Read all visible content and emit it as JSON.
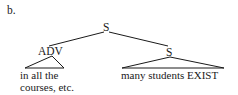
{
  "example_label": "b.",
  "tree": {
    "root": {
      "label": "S",
      "children": [
        {
          "label": "ADV",
          "terminal_lines": [
            "in all the",
            "courses, etc."
          ],
          "triangle": true
        },
        {
          "label": "S",
          "terminal_lines": [
            "many students EXIST"
          ],
          "triangle": true
        }
      ]
    }
  }
}
